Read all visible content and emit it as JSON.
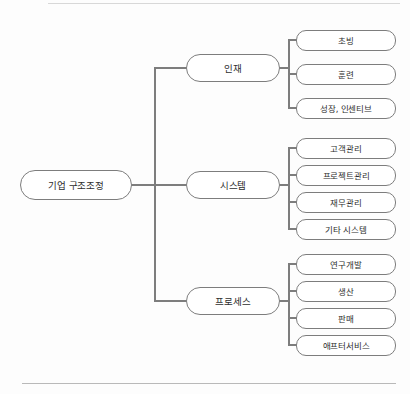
{
  "page": {
    "title": "기업 구조조정",
    "stroke_color": "#7d7d7d",
    "node_fill": "#ffffff",
    "background": "#fdfdfd",
    "rule_color": "#cfcfcf"
  },
  "diagram": {
    "type": "org-tree",
    "orientation": "left-to-right",
    "root": {
      "label": "기업 구조조정"
    },
    "branches": [
      {
        "label": "인재",
        "leaves": [
          {
            "label": "초빙"
          },
          {
            "label": "훈련"
          },
          {
            "label": "성장, 인센티브"
          }
        ]
      },
      {
        "label": "시스템",
        "leaves": [
          {
            "label": "고객관리"
          },
          {
            "label": "프로젝트관리"
          },
          {
            "label": "재무관리"
          },
          {
            "label": "기타 시스템"
          }
        ]
      },
      {
        "label": "프로세스",
        "leaves": [
          {
            "label": "연구개발"
          },
          {
            "label": "생산"
          },
          {
            "label": "판매"
          },
          {
            "label": "애프터서비스"
          }
        ]
      }
    ]
  },
  "geometry": {
    "root": {
      "x": 20,
      "y": 170,
      "w": 112,
      "h": 30
    },
    "trunk_x": 155,
    "root_center_y": 185,
    "mid_x": 186,
    "mid_w": 94,
    "mid_h": 28,
    "mid_centers": [
      68,
      185,
      301
    ],
    "leaf_trunk_offset": 9,
    "leaf_x": 296,
    "leaf_w": 100,
    "leaf_h": 21,
    "leaf_centers": [
      [
        40,
        74,
        108
      ],
      [
        148,
        175,
        202,
        229
      ],
      [
        264,
        291,
        318,
        345
      ]
    ]
  },
  "rules": {
    "top": {
      "x": 48,
      "y": 3,
      "w": 352
    },
    "bottom": {
      "x": 22,
      "y": 383,
      "w": 374
    }
  }
}
